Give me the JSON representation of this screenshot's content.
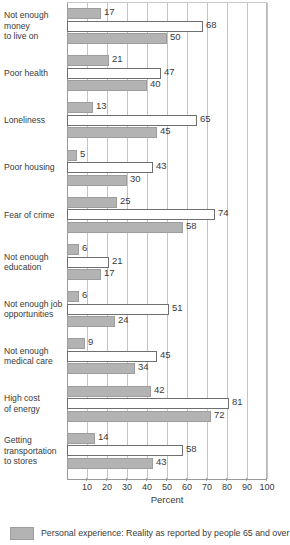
{
  "chart_data": {
    "type": "bar",
    "orientation": "horizontal",
    "title": "",
    "xlabel": "Percent",
    "ylabel": "",
    "xlim": [
      0,
      100
    ],
    "xticks": [
      10,
      20,
      30,
      40,
      50,
      60,
      70,
      80,
      90,
      100
    ],
    "grid": true,
    "legend_position": "bottom",
    "categories": [
      "Not enough\nmoney\nto live on",
      "Poor health",
      "Loneliness",
      "Poor housing",
      "Fear of crime",
      "Not enough\neducation",
      "Not enough job\nopportunities",
      "Not enough\nmedical care",
      "High cost\nof energy",
      "Getting\ntransportation\nto stores"
    ],
    "series": [
      {
        "name": "bar-1",
        "style": "filled",
        "values": [
          17,
          21,
          13,
          5,
          25,
          6,
          6,
          9,
          42,
          14
        ]
      },
      {
        "name": "bar-2",
        "style": "hollow",
        "values": [
          68,
          47,
          65,
          43,
          74,
          21,
          51,
          45,
          81,
          58
        ]
      },
      {
        "name": "bar-3",
        "style": "filled",
        "values": [
          50,
          40,
          45,
          30,
          58,
          17,
          24,
          34,
          72,
          43
        ]
      }
    ],
    "legend": [
      {
        "label": "Personal experience: Reality as reported by people 65 and over",
        "style": "filled"
      }
    ],
    "colors": {
      "filled_fill": "#b3b3b3",
      "filled_border": "#9d9d9d",
      "hollow_fill": "#ffffff",
      "hollow_border": "#6f6f6f",
      "grid": "#c4c4c4",
      "axis": "#9a9a9a",
      "text": "#3a3a3a"
    }
  }
}
